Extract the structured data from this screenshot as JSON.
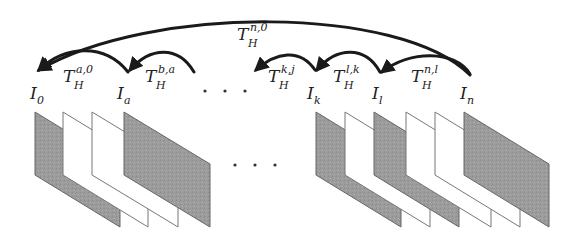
{
  "diagram": {
    "frames": [
      {
        "id": "I_0",
        "base": "I",
        "sub": "0",
        "fill": "gray"
      },
      {
        "id": "w1",
        "fill": "white"
      },
      {
        "id": "w2",
        "fill": "white"
      },
      {
        "id": "I_a",
        "base": "I",
        "sub": "a",
        "fill": "gray"
      },
      {
        "id": "I_k",
        "base": "I",
        "sub": "k",
        "fill": "gray"
      },
      {
        "id": "w3",
        "fill": "white"
      },
      {
        "id": "I_l",
        "base": "I",
        "sub": "l",
        "fill": "gray"
      },
      {
        "id": "w4",
        "fill": "white"
      },
      {
        "id": "w5",
        "fill": "white"
      },
      {
        "id": "I_n",
        "base": "I",
        "sub": "n",
        "fill": "gray"
      }
    ],
    "node_labels": [
      {
        "base": "I",
        "sub": "0"
      },
      {
        "base": "I",
        "sub": "a"
      },
      {
        "base": "I",
        "sub": "k"
      },
      {
        "base": "I",
        "sub": "l"
      },
      {
        "base": "I",
        "sub": "n"
      }
    ],
    "arrows": [
      {
        "from": "I_n",
        "to": "I_0",
        "base": "T",
        "sub": "H",
        "sup": "n,0"
      },
      {
        "from": "I_a",
        "to": "I_0",
        "base": "T",
        "sub": "H",
        "sup": "a,0"
      },
      {
        "from": "I_b",
        "to": "I_a",
        "base": "T",
        "sub": "H",
        "sup": "b,a"
      },
      {
        "from": "I_k",
        "to": "I_j",
        "base": "T",
        "sub": "H",
        "sup": "k,j"
      },
      {
        "from": "I_l",
        "to": "I_k",
        "base": "T",
        "sub": "H",
        "sup": "l,k"
      },
      {
        "from": "I_n",
        "to": "I_l",
        "base": "T",
        "sub": "H",
        "sup": "n,l"
      }
    ],
    "ellipsis": "· · ·",
    "colors": {
      "gray_fill": "#9a9a9a",
      "stroke": "#1a1a1a",
      "frame_edge": "#666666"
    }
  }
}
